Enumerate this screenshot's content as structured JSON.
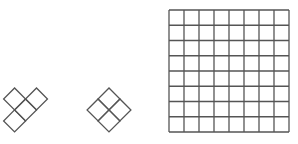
{
  "diagram": {
    "stroke_color": "#555555",
    "background": "#ffffff",
    "pieces": [
      {
        "name": "tetromino-piece",
        "cells": [
          [
            0,
            0
          ],
          [
            1,
            0
          ],
          [
            1,
            1
          ],
          [
            2,
            1
          ]
        ],
        "rotation_deg": 45,
        "cell_count": 4
      },
      {
        "name": "square-piece",
        "cells": [
          [
            0,
            0
          ],
          [
            1,
            0
          ],
          [
            0,
            1
          ],
          [
            1,
            1
          ]
        ],
        "rotation_deg": 45,
        "cell_count": 4
      }
    ],
    "board": {
      "rows": 8,
      "cols": 8
    }
  }
}
